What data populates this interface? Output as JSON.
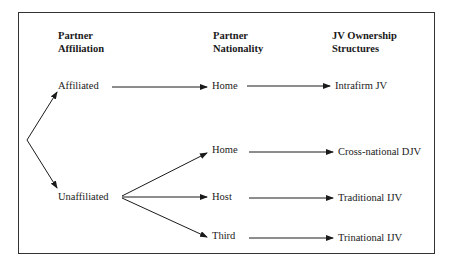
{
  "headers": {
    "col1": [
      "Partner",
      "Affiliation"
    ],
    "col2": [
      "Partner",
      "Nationality"
    ],
    "col3": [
      "JV Ownership",
      "Structures"
    ]
  },
  "affiliation": {
    "affiliated": "Affiliated",
    "unaffiliated": "Unaffiliated"
  },
  "nationality": {
    "home_affiliated": "Home",
    "home": "Home",
    "host": "Host",
    "third": "Third"
  },
  "structures": {
    "intrafirm": "Intrafirm JV",
    "cross_national": "Cross-national DJV",
    "traditional": "Traditional IJV",
    "trinational": "Trinational IJV"
  },
  "colors": {
    "line": "#1a1a1a",
    "border": "#333333"
  }
}
